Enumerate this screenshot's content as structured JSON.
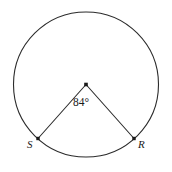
{
  "figure": {
    "type": "circle-with-central-angle",
    "background_color": "#ffffff",
    "stroke_color": "#2b2b2b",
    "label_color": "#1a1a1a",
    "circle": {
      "center_x": 86,
      "center_y": 84.5,
      "radius": 72.5,
      "stroke_width": 1.1
    },
    "center_marker": {
      "name": "center-point",
      "x": 86,
      "y": 84.5,
      "size": 3.6
    },
    "radii": [
      {
        "name": "radius-to-S",
        "from_x": 86,
        "from_y": 84.5,
        "to_x": 38,
        "to_y": 138.5
      },
      {
        "name": "radius-to-R",
        "from_x": 86,
        "from_y": 84.5,
        "to_x": 134,
        "to_y": 138.5
      }
    ],
    "vertices": [
      {
        "name": "point-S",
        "label": "S",
        "x": 38,
        "y": 138.5,
        "size": 3.4
      },
      {
        "name": "point-R",
        "label": "R",
        "x": 134,
        "y": 138.5,
        "size": 3.4
      }
    ],
    "angle": {
      "name": "central-angle",
      "label": "84°",
      "value": 84,
      "unit": "degrees"
    }
  }
}
